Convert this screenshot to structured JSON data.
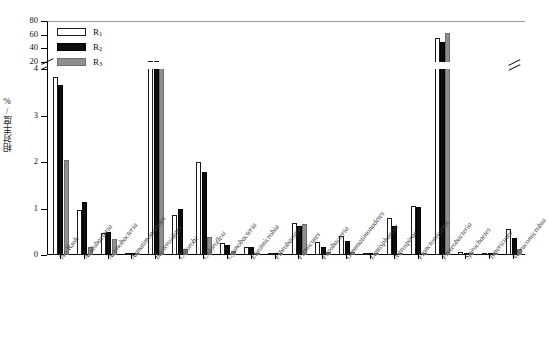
{
  "chart_data": {
    "type": "bar",
    "title": "",
    "xlabel": "",
    "ylabel": "相对丰度/%",
    "ylim": [
      0,
      80
    ],
    "grid": false,
    "axis_break": {
      "lower_max": 4,
      "upper_min": 20,
      "note": "y-axis broken between 4 and 20"
    },
    "y_ticks_lower": [
      "0",
      "1",
      "2",
      "3",
      "4"
    ],
    "y_ticks_upper": [
      "20",
      "40",
      "60",
      "80"
    ],
    "legend_position": "top-left",
    "categories": [
      "No Rank",
      "Acidobacteria",
      "Actinobacteria",
      "Armatimonadetes",
      "Bacteroidetes",
      "Chlorobi",
      "Chloroflexi",
      "Cyanobacteria",
      "Elusimicrobia",
      "Fibrobacteres",
      "Firmicutes",
      "Fusobacteria",
      "Gemmatimonadetes",
      "Lentisphaerae",
      "Nitrospirae",
      "Planctomycetes",
      "Proteobacteria",
      "Spirochaetes",
      "Tenericutes",
      "Verrucomicrobia"
    ],
    "series": [
      {
        "name": "R1",
        "label": "R",
        "sub": "1",
        "color": "#ffffff",
        "edge": "#1a1a1a",
        "values": [
          3.82,
          0.97,
          0.48,
          0.03,
          22.0,
          0.85,
          2.0,
          0.26,
          0.17,
          0.02,
          0.69,
          0.27,
          0.41,
          0.02,
          0.8,
          1.05,
          55.0,
          0.07,
          0.02,
          0.56
        ]
      },
      {
        "name": "R2",
        "label": "R",
        "sub": "2",
        "color": "#0d0d0d",
        "edge": "#000000",
        "values": [
          3.65,
          1.13,
          0.5,
          0.01,
          21.0,
          1.0,
          1.78,
          0.22,
          0.17,
          0.01,
          0.62,
          0.17,
          0.3,
          0.01,
          0.62,
          1.04,
          49.0,
          0.03,
          0.01,
          0.36
        ]
      },
      {
        "name": "R3",
        "label": "R",
        "sub": "3",
        "color": "#8f8f8f",
        "edge": "#6e6e6e",
        "values": [
          2.04,
          0.17,
          0.34,
          0.01,
          20.0,
          0.14,
          0.38,
          0.08,
          0.04,
          0.01,
          0.67,
          0.06,
          0.06,
          0.01,
          0.05,
          0.05,
          63.0,
          0.02,
          0.01,
          0.14
        ]
      }
    ]
  }
}
